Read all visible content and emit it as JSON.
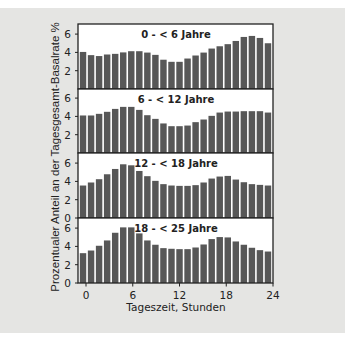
{
  "chart_data": {
    "type": "bar",
    "layout": "four vertically stacked panels sharing x-axis",
    "xlabel": "Tageszeit, Stunden",
    "ylabel": "Prozentualer Anteil an der Tagesgesamt-Basalrate %",
    "x_ticks": [
      "0",
      "6",
      "12",
      "18",
      "24"
    ],
    "x_tick_values": [
      0,
      6,
      12,
      18,
      24
    ],
    "y_ticks": [
      "0",
      "2",
      "4",
      "6"
    ],
    "ylim": [
      0,
      7
    ],
    "grid": false,
    "bar_color": "#575757",
    "background_color": "#e5e5e3",
    "panel_background": "#ffffff",
    "hours": [
      0,
      1,
      2,
      3,
      4,
      5,
      6,
      7,
      8,
      9,
      10,
      11,
      12,
      13,
      14,
      15,
      16,
      17,
      18,
      19,
      20,
      21,
      22,
      23
    ],
    "panels": [
      {
        "title": "0 - < 6 Jahre",
        "show_zero_tick": false,
        "values": [
          4.05,
          3.7,
          3.6,
          3.77,
          3.84,
          4.0,
          4.13,
          4.13,
          3.98,
          3.73,
          3.2,
          2.97,
          2.97,
          3.33,
          3.66,
          3.98,
          4.42,
          4.67,
          4.9,
          5.25,
          5.69,
          5.8,
          5.58,
          5.0
        ]
      },
      {
        "title": "6 - < 12 Jahre",
        "show_zero_tick": false,
        "values": [
          4.1,
          4.1,
          4.28,
          4.5,
          4.82,
          5.04,
          5.04,
          4.71,
          4.13,
          3.73,
          3.23,
          2.93,
          2.93,
          3.0,
          3.37,
          3.66,
          4.06,
          4.42,
          4.53,
          4.53,
          4.57,
          4.57,
          4.57,
          4.42
        ]
      },
      {
        "title": "12 - < 18 Jahre",
        "show_zero_tick": true,
        "values": [
          3.55,
          3.88,
          4.24,
          4.78,
          5.36,
          5.87,
          5.76,
          5.14,
          4.57,
          4.06,
          3.7,
          3.55,
          3.51,
          3.51,
          3.59,
          3.88,
          4.31,
          4.53,
          4.6,
          4.2,
          3.91,
          3.7,
          3.62,
          3.55
        ]
      },
      {
        "title": "18 - < 25 Jahre",
        "show_zero_tick": true,
        "values": [
          3.26,
          3.55,
          4.07,
          4.65,
          5.49,
          6.08,
          6.08,
          5.42,
          4.65,
          4.18,
          3.81,
          3.74,
          3.7,
          3.7,
          3.88,
          4.21,
          4.8,
          5.02,
          4.98,
          4.54,
          4.18,
          3.85,
          3.59,
          3.44
        ]
      }
    ]
  }
}
